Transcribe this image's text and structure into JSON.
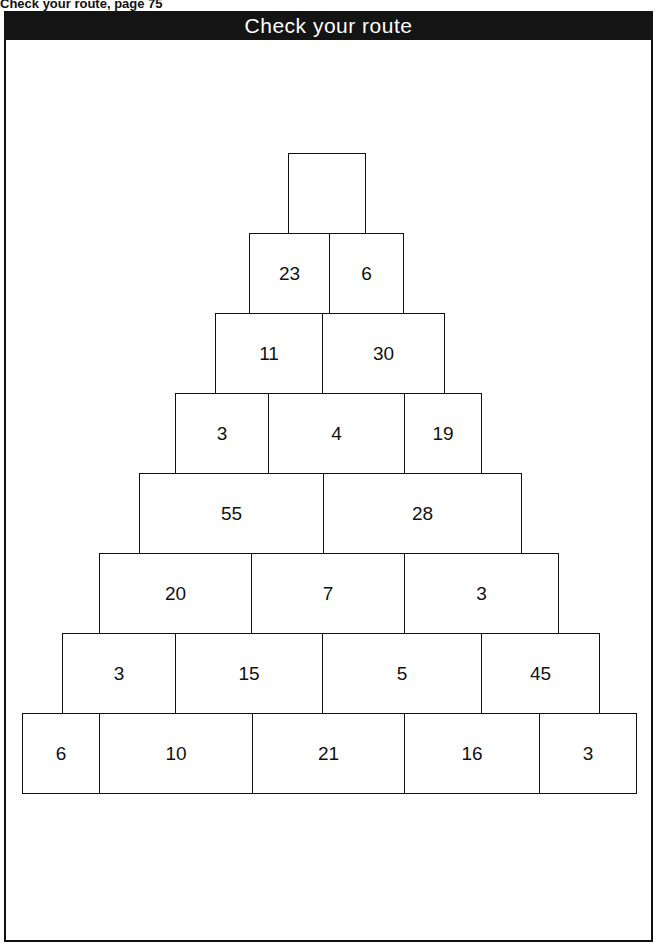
{
  "caption": "Check your route, page 75",
  "title": "Check your route",
  "pyramid": {
    "rows": [
      {
        "cells": [
          {
            "value": "",
            "x": 288,
            "w": 77
          }
        ]
      },
      {
        "cells": [
          {
            "value": "23",
            "x": 249,
            "w": 80
          },
          {
            "value": "6",
            "x": 329,
            "w": 74
          }
        ]
      },
      {
        "cells": [
          {
            "value": "11",
            "x": 215,
            "w": 107
          },
          {
            "value": "30",
            "x": 322,
            "w": 122
          }
        ]
      },
      {
        "cells": [
          {
            "value": "3",
            "x": 175,
            "w": 93
          },
          {
            "value": "4",
            "x": 268,
            "w": 136
          },
          {
            "value": "19",
            "x": 404,
            "w": 77
          }
        ]
      },
      {
        "cells": [
          {
            "value": "55",
            "x": 139,
            "w": 184
          },
          {
            "value": "28",
            "x": 323,
            "w": 198
          }
        ]
      },
      {
        "cells": [
          {
            "value": "20",
            "x": 99,
            "w": 152
          },
          {
            "value": "7",
            "x": 251,
            "w": 153
          },
          {
            "value": "3",
            "x": 404,
            "w": 154
          }
        ]
      },
      {
        "cells": [
          {
            "value": "3",
            "x": 62,
            "w": 113
          },
          {
            "value": "15",
            "x": 175,
            "w": 147
          },
          {
            "value": "5",
            "x": 322,
            "w": 159
          },
          {
            "value": "45",
            "x": 481,
            "w": 118
          }
        ]
      },
      {
        "cells": [
          {
            "value": "6",
            "x": 22,
            "w": 77
          },
          {
            "value": "10",
            "x": 99,
            "w": 153
          },
          {
            "value": "21",
            "x": 252,
            "w": 152
          },
          {
            "value": "16",
            "x": 404,
            "w": 135
          },
          {
            "value": "3",
            "x": 539,
            "w": 97
          }
        ]
      }
    ],
    "row_tops": [
      153,
      233,
      313,
      393,
      473,
      553,
      633,
      713
    ],
    "row_height": 81
  }
}
